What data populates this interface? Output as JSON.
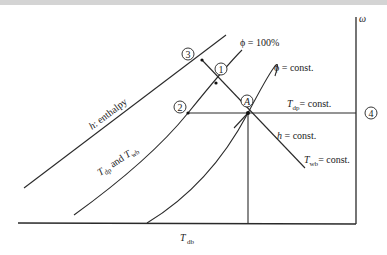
{
  "diagram": {
    "type": "psychrometric-chart-schematic",
    "axes": {
      "x_label": "T",
      "x_label_sub": "db",
      "y_label": "ω"
    },
    "points": [
      {
        "id": "A",
        "label": "A"
      },
      {
        "id": "1",
        "label": "1"
      },
      {
        "id": "2",
        "label": "2"
      },
      {
        "id": "3",
        "label": "3"
      },
      {
        "id": "4",
        "label": "4"
      }
    ],
    "curve_labels": {
      "phi_100": "ϕ = 100%",
      "phi_const": "ϕ = const.",
      "enthalpy": "h: enthalpy",
      "enthalpy_h": "h",
      "enthalpy_rest": ": enthalpy",
      "tdp_twb_T1": "T",
      "tdp_twb_sub1": "dp",
      "tdp_twb_mid": " and ",
      "tdp_twb_T2": "T",
      "tdp_twb_sub2": "wb",
      "tdp_const_T": "T",
      "tdp_const_sub": "dp",
      "tdp_const_rest": "= const.",
      "h_const_h": "h",
      "h_const_rest": " = const.",
      "twb_const_T": "T",
      "twb_const_sub": "wb",
      "twb_const_rest": "= const."
    }
  }
}
